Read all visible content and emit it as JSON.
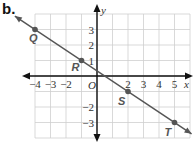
{
  "figure_label": "b.",
  "axes": {
    "x_name": "x",
    "y_name": "y",
    "origin_label": "O",
    "x_ticks": [
      {
        "value": -4,
        "label": "−4"
      },
      {
        "value": -3,
        "label": "−3"
      },
      {
        "value": -2,
        "label": "−2"
      },
      {
        "value": 2,
        "label": "2"
      },
      {
        "value": 3,
        "label": "3"
      },
      {
        "value": 4,
        "label": "4"
      },
      {
        "value": 5,
        "label": "5"
      }
    ],
    "y_ticks": [
      {
        "value": 3,
        "label": "3"
      },
      {
        "value": 2,
        "label": "2"
      },
      {
        "value": 1,
        "label": "1"
      },
      {
        "value": -2,
        "label": "−2"
      },
      {
        "value": -3,
        "label": "−3"
      }
    ]
  },
  "points": [
    {
      "name": "Q",
      "x": -4,
      "y": 3
    },
    {
      "name": "R",
      "x": -1,
      "y": 1
    },
    {
      "name": "S",
      "x": 2,
      "y": -1
    },
    {
      "name": "T",
      "x": 5,
      "y": -3
    }
  ],
  "colors": {
    "grid": "#cfcfcf",
    "axis": "#111111",
    "line": "#555555",
    "point": "#555555",
    "label": "#555555"
  },
  "chart_data": {
    "type": "line",
    "title": "",
    "xlabel": "x",
    "ylabel": "y",
    "xlim": [
      -4,
      6
    ],
    "ylim": [
      -4,
      4
    ],
    "grid": true,
    "series": [
      {
        "name": "line QT",
        "x": [
          -4,
          -1,
          2,
          5
        ],
        "y": [
          3,
          1,
          -1,
          -3
        ],
        "labels": [
          "Q",
          "R",
          "S",
          "T"
        ],
        "slope": -0.6667
      }
    ]
  }
}
